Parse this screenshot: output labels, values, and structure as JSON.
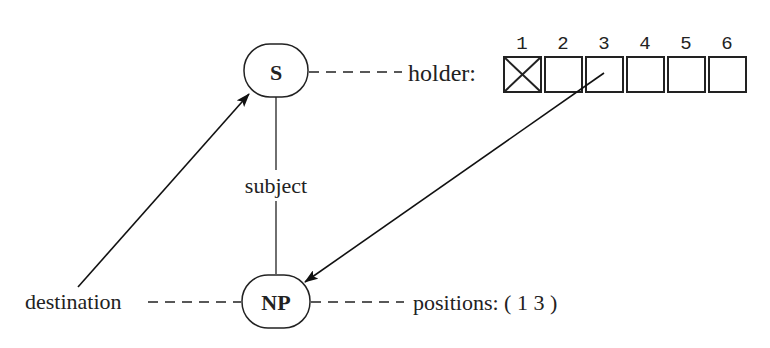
{
  "nodes": {
    "s": {
      "label": "S"
    },
    "np": {
      "label": "NP"
    }
  },
  "edge_labels": {
    "subject": "subject"
  },
  "annotations": {
    "holder": "holder:",
    "destination": "destination",
    "positions": "positions: ( 1  3 )"
  },
  "holder_slots": {
    "indices": [
      "1",
      "2",
      "3",
      "4",
      "5",
      "6"
    ],
    "filled": [
      true,
      false,
      false,
      false,
      false,
      false
    ]
  }
}
